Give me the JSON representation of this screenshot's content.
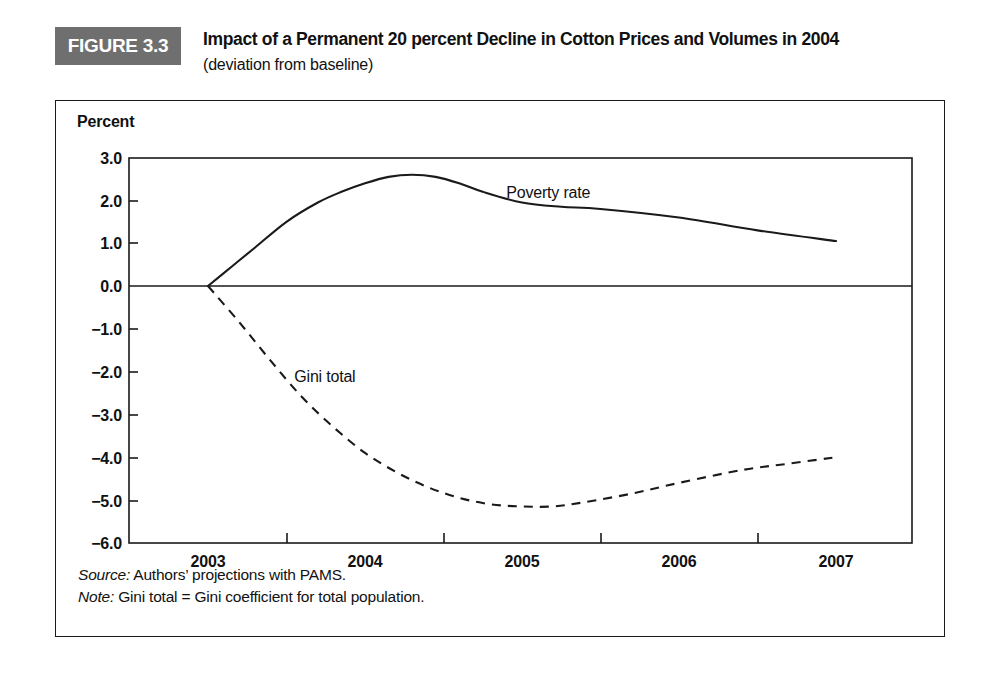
{
  "figure": {
    "tag": "FIGURE 3.3",
    "title": "Impact of a Permanent 20 percent Decline in Cotton Prices and Volumes in 2004",
    "subtitle": "(deviation from baseline)",
    "tag_background": "#6f6f6f",
    "tag_text_color": "#ffffff"
  },
  "footnotes": {
    "source_key": "Source:",
    "source_text": " Authors’ projections with PAMS.",
    "note_key": "Note:",
    "note_text": " Gini total = Gini coefficient for total population."
  },
  "chart_data": {
    "type": "line",
    "title": "Impact of a Permanent 20 percent Decline in Cotton Prices and Volumes in 2004",
    "subtitle": "(deviation from baseline)",
    "xlabel": "",
    "ylabel": "Percent",
    "ylim": [
      -6.0,
      3.0
    ],
    "xlim": [
      2003,
      2007
    ],
    "grid": false,
    "legend_position": "inline-annotation",
    "y_ticks": [
      "3.0",
      "2.0",
      "1.0",
      "0.0",
      "−1.0",
      "−2.0",
      "−3.0",
      "−4.0",
      "−5.0",
      "−6.0"
    ],
    "y_tick_values": [
      3.0,
      2.0,
      1.0,
      0.0,
      -1.0,
      -2.0,
      -3.0,
      -4.0,
      -5.0,
      -6.0
    ],
    "x_ticks": [
      "2003",
      "2004",
      "2005",
      "2006",
      "2007"
    ],
    "x_tick_values": [
      2003,
      2004,
      2005,
      2006,
      2007
    ],
    "zero_line": 0.0,
    "series": [
      {
        "name": "Poverty rate",
        "style": "solid",
        "color": "#1a1a1a",
        "x": [
          2003.0,
          2003.15,
          2003.3,
          2003.5,
          2003.7,
          2003.85,
          2004.0,
          2004.15,
          2004.3,
          2004.45,
          2004.6,
          2004.75,
          2005.0,
          2005.25,
          2005.5,
          2006.0,
          2006.5,
          2007.0
        ],
        "values": [
          0.0,
          0.45,
          0.9,
          1.5,
          1.95,
          2.2,
          2.4,
          2.55,
          2.6,
          2.55,
          2.4,
          2.2,
          1.95,
          1.85,
          1.8,
          1.6,
          1.3,
          1.05
        ]
      },
      {
        "name": "Gini total",
        "style": "dashed",
        "color": "#1a1a1a",
        "x": [
          2003.0,
          2003.2,
          2003.4,
          2003.6,
          2003.8,
          2004.0,
          2004.2,
          2004.4,
          2004.6,
          2004.8,
          2005.0,
          2005.2,
          2005.4,
          2005.7,
          2006.0,
          2006.4,
          2006.7,
          2007.0
        ],
        "values": [
          0.0,
          -0.85,
          -1.75,
          -2.6,
          -3.3,
          -3.9,
          -4.35,
          -4.7,
          -4.95,
          -5.1,
          -5.15,
          -5.15,
          -5.05,
          -4.85,
          -4.6,
          -4.3,
          -4.15,
          -4.0
        ]
      }
    ],
    "annotations": [
      {
        "text": "Poverty rate",
        "x": 2004.9,
        "y": 2.05
      },
      {
        "text": "Gini total",
        "x": 2003.55,
        "y": -2.25
      }
    ]
  }
}
